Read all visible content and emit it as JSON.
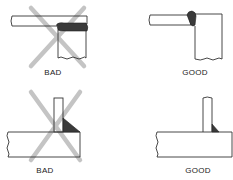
{
  "panels": [
    {
      "id": "top-left",
      "joint": "lap-edge",
      "verdict": "BAD",
      "label": "BAD",
      "crossed_out": true
    },
    {
      "id": "top-right",
      "joint": "lap-edge",
      "verdict": "GOOD",
      "label": "GOOD",
      "crossed_out": false
    },
    {
      "id": "bottom-left",
      "joint": "tee-fillet",
      "verdict": "BAD",
      "label": "BAD",
      "crossed_out": true
    },
    {
      "id": "bottom-right",
      "joint": "tee-fillet",
      "verdict": "GOOD",
      "label": "GOOD",
      "crossed_out": false
    }
  ],
  "colors": {
    "outline": "#333333",
    "weld": "#3a3a3a",
    "cross": "#c4c4c4",
    "background": "#ffffff"
  }
}
